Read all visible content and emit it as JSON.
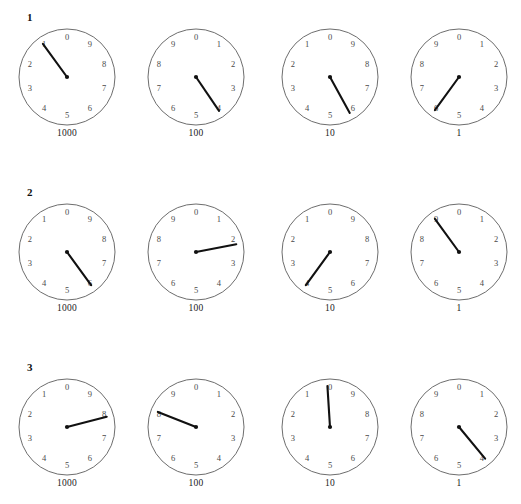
{
  "worksheet": {
    "title": "Meter dial reading worksheet",
    "background_color": "#ffffff",
    "ink_color": "#111111",
    "dial_outline_color": "#5c5c5c",
    "digit_color": "#4a4a4a",
    "dial_digits": [
      "0",
      "1",
      "2",
      "3",
      "4",
      "5",
      "6",
      "7",
      "8",
      "9"
    ],
    "dial_captions": [
      "1000",
      "100",
      "10",
      "1"
    ],
    "rows": [
      {
        "label": "1",
        "dials": [
          {
            "caption": "1000",
            "direction": "counter-clockwise",
            "value": 1,
            "pointer_value": 1.0
          },
          {
            "caption": "100",
            "direction": "clockwise",
            "value": 4,
            "pointer_value": 4.05
          },
          {
            "caption": "10",
            "direction": "counter-clockwise",
            "value": 5,
            "pointer_value": 5.8
          },
          {
            "caption": "1",
            "direction": "clockwise",
            "value": 6,
            "pointer_value": 6.0
          }
        ]
      },
      {
        "label": "2",
        "dials": [
          {
            "caption": "1000",
            "direction": "counter-clockwise",
            "value": 6,
            "pointer_value": 6.0
          },
          {
            "caption": "100",
            "direction": "clockwise",
            "value": 2,
            "pointer_value": 2.2
          },
          {
            "caption": "10",
            "direction": "counter-clockwise",
            "value": 4,
            "pointer_value": 4.0
          },
          {
            "caption": "1",
            "direction": "clockwise",
            "value": 9,
            "pointer_value": 9.0
          }
        ]
      },
      {
        "label": "3",
        "dials": [
          {
            "caption": "1000",
            "direction": "counter-clockwise",
            "value": 8,
            "pointer_value": 7.9
          },
          {
            "caption": "100",
            "direction": "clockwise",
            "value": 8,
            "pointer_value": 8.1
          },
          {
            "caption": "10",
            "direction": "counter-clockwise",
            "value": 0,
            "pointer_value": 0.1
          },
          {
            "caption": "1",
            "direction": "clockwise",
            "value": 4,
            "pointer_value": 3.9
          }
        ]
      }
    ]
  }
}
